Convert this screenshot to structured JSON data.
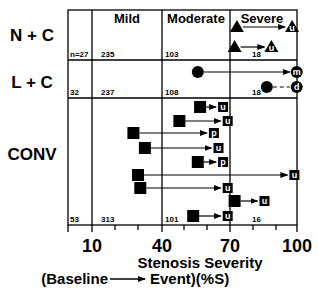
{
  "chart_data": {
    "type": "scatter",
    "title": "",
    "xlabel": "Stenosis Severity",
    "xlabel_line2": "(Baseline → Event)(%S)",
    "xlim": [
      0,
      100
    ],
    "x_ticks": [
      10,
      40,
      70,
      100
    ],
    "x_minor_ticks": [
      20,
      30,
      50,
      60,
      80,
      90
    ],
    "severity_columns": [
      "Mild",
      "Moderate",
      "Severe"
    ],
    "rows": [
      {
        "name": "N + C",
        "marker": "triangle",
        "counts": [
          "n=27",
          "235",
          "103",
          "18"
        ],
        "transitions": [
          {
            "baseline": 73,
            "event": 97,
            "label": "u",
            "line": "solid"
          },
          {
            "baseline": 72,
            "event": 88,
            "label": "u",
            "line": "solid"
          }
        ]
      },
      {
        "name": "L + C",
        "marker": "circle",
        "counts": [
          "32",
          "237",
          "108",
          "18"
        ],
        "transitions": [
          {
            "baseline": 56,
            "event": 99,
            "label": "m",
            "line": "solid"
          },
          {
            "baseline": 86,
            "event": 99,
            "label": "d",
            "line": "dashed"
          }
        ]
      },
      {
        "name": "CONV",
        "marker": "square",
        "counts": [
          "53",
          "313",
          "101",
          "16"
        ],
        "transitions": [
          {
            "baseline": 57,
            "event": 67,
            "label": "u",
            "line": "solid"
          },
          {
            "baseline": 48,
            "event": 69,
            "label": "u",
            "line": "solid"
          },
          {
            "baseline": 28,
            "event": 63,
            "label": "p",
            "line": "solid"
          },
          {
            "baseline": 33,
            "event": 65,
            "label": "u",
            "line": "solid"
          },
          {
            "baseline": 56,
            "event": 67,
            "label": "p",
            "line": "solid"
          },
          {
            "baseline": 30,
            "event": 98,
            "label": "u",
            "line": "solid"
          },
          {
            "baseline": 31,
            "event": 69,
            "label": "u",
            "line": "solid"
          },
          {
            "baseline": 72,
            "event": 85,
            "label": "u",
            "line": "solid"
          },
          {
            "baseline": 54,
            "event": 69,
            "label": "u",
            "line": "solid"
          }
        ]
      }
    ],
    "grid": false,
    "legend": "none"
  },
  "labels": {
    "row_nc": "N + C",
    "row_lc": "L + C",
    "row_conv": "CONV",
    "col_mild": "Mild",
    "col_moderate": "Moderate",
    "col_severe": "Severe",
    "nc_c0": "n=27",
    "nc_c1": "235",
    "nc_c2": "103",
    "nc_c3": "18",
    "lc_c0": "32",
    "lc_c1": "237",
    "lc_c2": "108",
    "lc_c3": "18",
    "cv_c0": "53",
    "cv_c1": "313",
    "cv_c2": "101",
    "cv_c3": "16",
    "tick_10": "10",
    "tick_40": "40",
    "tick_70": "70",
    "tick_100": "100",
    "xlabel1": "Stenosis Severity",
    "xlabel2a": "(Baseline",
    "xlabel2b": "Event)(%S)"
  }
}
